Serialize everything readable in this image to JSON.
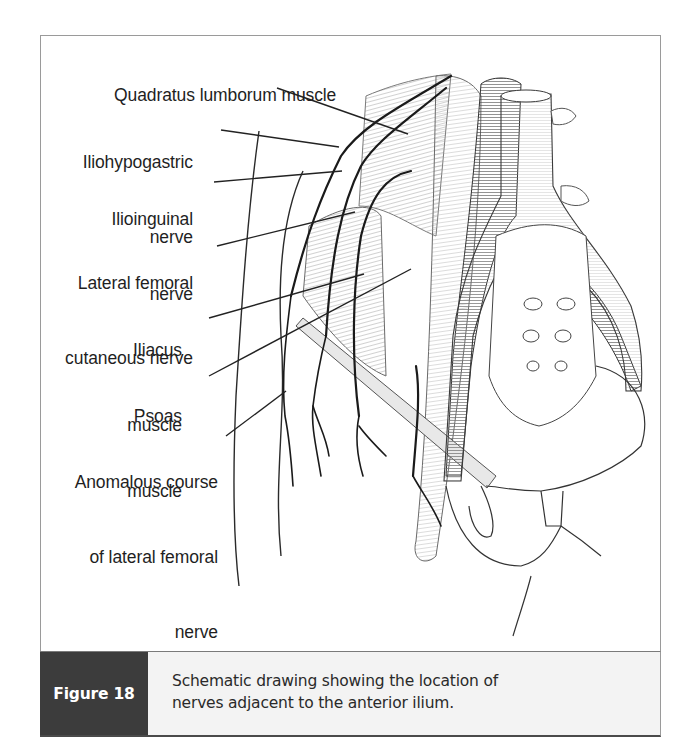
{
  "figure": {
    "number_label": "Figure 18",
    "caption_line_1": "Schematic drawing showing the location of",
    "caption_line_2": "nerves adjacent to the anterior ilium.",
    "colors": {
      "caption_tag_bg": "#3c3c3c",
      "caption_text_bg": "#f3f3f3",
      "frame_border": "#9a9a9a",
      "label_text": "#1f1f1f"
    }
  },
  "labels": [
    {
      "id": "quadratus-lumborum",
      "lines": [
        "Quadratus lumborum muscle"
      ]
    },
    {
      "id": "iliohypogastric",
      "lines": [
        "Iliohypogastric",
        "nerve"
      ]
    },
    {
      "id": "ilioinguinal",
      "lines": [
        "Ilioinguinal",
        "nerve"
      ]
    },
    {
      "id": "lateral-femoral-cutaneous",
      "lines": [
        "Lateral femoral",
        "cutaneous nerve"
      ]
    },
    {
      "id": "iliacus",
      "lines": [
        "Iliacus",
        "muscle"
      ]
    },
    {
      "id": "psoas",
      "lines": [
        "Psoas",
        "muscle"
      ]
    },
    {
      "id": "anomalous-course",
      "lines": [
        "Anomalous course",
        "of lateral femoral",
        "nerve"
      ]
    }
  ]
}
